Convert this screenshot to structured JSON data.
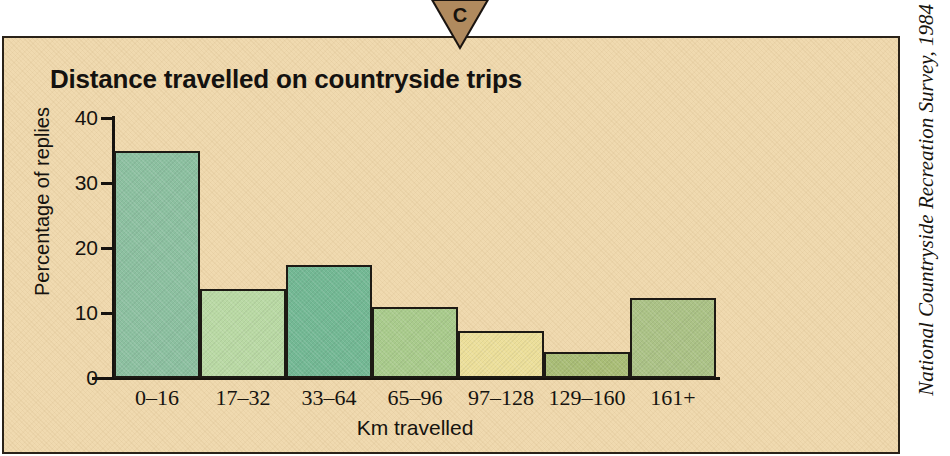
{
  "marker": {
    "label": "C",
    "shape": "triangle-down",
    "fill": "#b08a5e",
    "stroke": "#1a1410"
  },
  "panel": {
    "background": "#f0dab0",
    "border_color": "#2a2218"
  },
  "source_credit": "National Countryside Recreation Survey, 1984",
  "chart_data": {
    "type": "bar",
    "title": "Distance travelled on countryside trips",
    "xlabel": "Km travelled",
    "ylabel": "Percentage of replies",
    "categories": [
      "0–16",
      "17–32",
      "33–64",
      "65–96",
      "97–128",
      "129–160",
      "161+"
    ],
    "values": [
      35.0,
      13.7,
      17.4,
      11.0,
      7.2,
      4.0,
      12.3
    ],
    "ylim": [
      0,
      40
    ],
    "yticks": [
      0,
      10,
      20,
      30,
      40
    ],
    "ytick_labels": [
      "0",
      "10",
      "20",
      "30",
      "40"
    ],
    "grid": false,
    "legend": "none",
    "bar_colors": [
      "#8cc0a0",
      "#b9d9a4",
      "#73b894",
      "#a9cb8c",
      "#ecdf9a",
      "#a9bd76",
      "#abc286"
    ],
    "bar_edge_color": "#1d1a14"
  }
}
